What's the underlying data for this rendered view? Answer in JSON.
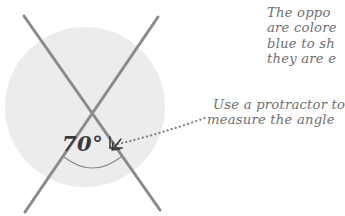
{
  "diagram": {
    "type": "geometry-angle-illustration",
    "background_color": "#ffffff",
    "circle": {
      "name": "shaded-circle",
      "fill_color": "#ececec",
      "center_x": 85,
      "center_y": 107,
      "radius": 80
    },
    "lines": [
      {
        "name": "line-a",
        "color": "#8a8a8a",
        "width": 3,
        "x1": 24,
        "y1": 16,
        "x2": 160,
        "y2": 210
      },
      {
        "name": "line-b",
        "color": "#8a8a8a",
        "width": 3,
        "x1": 158,
        "y1": 17,
        "x2": 25,
        "y2": 212
      }
    ],
    "intersection": {
      "x": 92,
      "y": 112
    },
    "angle_arc": {
      "name": "angle-arc",
      "color": "#8a8a8a",
      "width": 1.2,
      "start_x": 64,
      "start_y": 157,
      "end_x": 121,
      "end_y": 157,
      "sag_y": 168
    },
    "angle_label": "70°",
    "angle_value": 70,
    "angle_unit": "degrees",
    "leader": {
      "name": "dotted-leader-line",
      "color": "#7d7d7e",
      "style": "dotted",
      "dot_radius": 1.1,
      "arrow_x": 115,
      "arrow_y": 147,
      "path": "M 118 144 Q 160 134 205 118",
      "arrowhead": "down-left"
    },
    "corner_marker": {
      "name": "right-angle-corner-marker",
      "color": "#3a3a3c",
      "x": 112,
      "y": 142
    }
  },
  "annotations": {
    "top_note": {
      "name": "opposite-angles-note",
      "clipped_at_right_edge": true,
      "lines": [
        "The oppo",
        "are colore",
        "blue to sh",
        "they are e"
      ]
    },
    "bottom_note": {
      "name": "protractor-note",
      "clipped_at_right_edge": false,
      "lines": [
        "Use a protractor to",
        "measure the angle"
      ]
    }
  },
  "colors": {
    "circle_fill": "#ececec",
    "line_gray": "#8a8a8a",
    "text_gray": "#6f6f70",
    "label_dark": "#3a3a3c",
    "page_background": "#ffffff"
  }
}
